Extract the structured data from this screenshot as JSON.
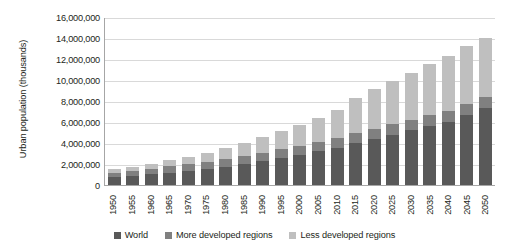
{
  "chart_data": {
    "type": "bar",
    "stacked": true,
    "title": "",
    "xlabel": "",
    "ylabel": "Urban population (thousands)",
    "ylim": [
      0,
      16000000
    ],
    "ytick_labels": [
      "16,000,000",
      "14,000,000",
      "12,000,000",
      "10,000,000",
      "8,000,000",
      "6,000,000",
      "4,000,000",
      "2,000,000",
      "0"
    ],
    "ytick_values": [
      16000000,
      14000000,
      12000000,
      10000000,
      8000000,
      6000000,
      4000000,
      2000000,
      0
    ],
    "grid": true,
    "legend_position": "bottom",
    "categories": [
      "1950",
      "1955",
      "1960",
      "1965",
      "1970",
      "1975",
      "1980",
      "1985",
      "1990",
      "1995",
      "2000",
      "2005",
      "2010",
      "2015",
      "2020",
      "2025",
      "2030",
      "2035",
      "2040",
      "2045",
      "2050"
    ],
    "series": [
      {
        "name": "World",
        "color": "#595959",
        "values": [
          750000,
          880000,
          1020000,
          1180000,
          1350000,
          1540000,
          1750000,
          1990000,
          2270000,
          2560000,
          2860000,
          3200000,
          3560000,
          3960000,
          4380000,
          4800000,
          5200000,
          5600000,
          6000000,
          6700000,
          7300000
        ]
      },
      {
        "name": "More developed regions",
        "color": "#808080",
        "values": [
          440000,
          490000,
          540000,
          590000,
          640000,
          690000,
          730000,
          770000,
          810000,
          840000,
          870000,
          900000,
          930000,
          950000,
          970000,
          990000,
          1010000,
          1030000,
          1050000,
          1060000,
          1070000
        ]
      },
      {
        "name": "Less developed regions",
        "color": "#bfbfbf",
        "values": [
          310000,
          390000,
          480000,
          590000,
          710000,
          850000,
          1020000,
          1220000,
          1460000,
          1720000,
          1990000,
          2300000,
          2630000,
          3400000,
          3750000,
          4100000,
          4490000,
          4870000,
          5250000,
          5470000,
          5680000
        ]
      }
    ]
  },
  "legend": {
    "items": [
      {
        "label": "World"
      },
      {
        "label": "More developed regions"
      },
      {
        "label": "Less developed regions"
      }
    ]
  }
}
